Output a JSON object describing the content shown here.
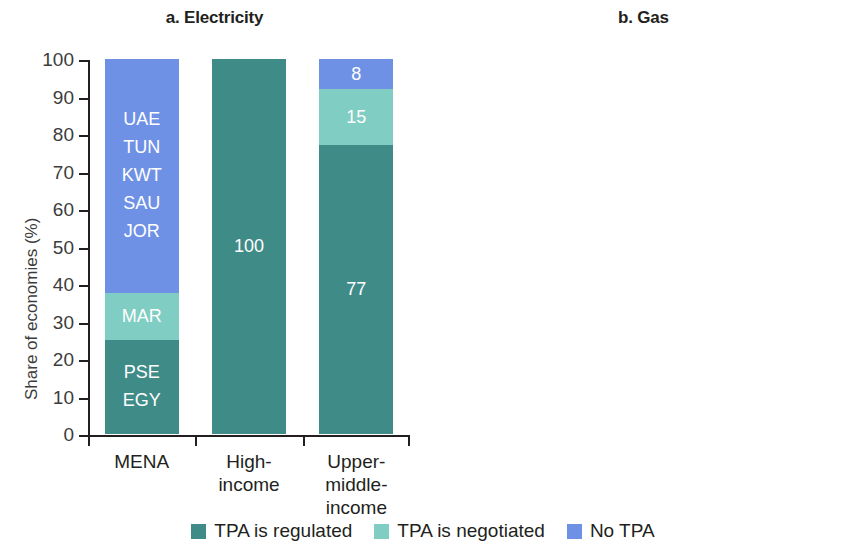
{
  "figure": {
    "ylabel": "Share of economies (%)",
    "y_ticks": [
      "100",
      "90",
      "80",
      "70",
      "60",
      "50",
      "40",
      "30",
      "20",
      "10",
      "0"
    ],
    "categories": [
      "MENA",
      "High-\nincome",
      "Upper-\nmiddle-\nincome"
    ]
  },
  "colors": {
    "regulated": "#3f8b88",
    "negotiated": "#7fcdc3",
    "no_tpa": "#6e91e6",
    "axis": "#231f20",
    "tick_text": "#3c3c3c"
  },
  "legend": {
    "items": [
      {
        "label": "TPA is regulated",
        "color": "#3f8b88"
      },
      {
        "label": "TPA is negotiated",
        "color": "#7fcdc3"
      },
      {
        "label": "No TPA",
        "color": "#6e91e6"
      }
    ]
  },
  "panels": [
    {
      "id": "a",
      "title": "a. Electricity",
      "ylabel": "Share of economies (%)",
      "bars": [
        {
          "category": "MENA",
          "category_lines": [
            "MENA"
          ],
          "segments": [
            {
              "series": "No TPA",
              "value": 62.5,
              "label": "",
              "economies": [
                "UAE",
                "TUN",
                "KWT",
                "SAU",
                "JOR"
              ]
            },
            {
              "series": "TPA is negotiated",
              "value": 12.5,
              "label": "",
              "economies": [
                "MAR"
              ]
            },
            {
              "series": "TPA is regulated",
              "value": 25,
              "label": "",
              "economies": [
                "PSE",
                "EGY"
              ]
            }
          ]
        },
        {
          "category": "High-income",
          "category_lines": [
            "High-",
            "income"
          ],
          "segments": [
            {
              "series": "TPA is regulated",
              "value": 100,
              "label": "100",
              "economies": []
            }
          ]
        },
        {
          "category": "Upper-middle-income",
          "category_lines": [
            "Upper-",
            "middle-",
            "income"
          ],
          "segments": [
            {
              "series": "No TPA",
              "value": 8,
              "label": "8",
              "economies": []
            },
            {
              "series": "TPA is negotiated",
              "value": 15,
              "label": "15",
              "economies": []
            },
            {
              "series": "TPA is regulated",
              "value": 77,
              "label": "77",
              "economies": []
            }
          ]
        }
      ]
    },
    {
      "id": "b",
      "title": "b. Gas",
      "ylabel": "Share of economies (%)",
      "bars": [
        {
          "category": "MENA",
          "category_lines": [
            "MENA"
          ],
          "segments": [
            {
              "series": "No TPA",
              "value": 62.5,
              "label": "",
              "economies": [
                "UAE",
                "TUN",
                "KWT",
                "SAU",
                "JOR"
              ]
            },
            {
              "series": "TPA is regulated",
              "value": 37.5,
              "label": "",
              "economies": [
                "PSE",
                "MAR",
                "EGY"
              ]
            }
          ]
        },
        {
          "category": "High-income",
          "category_lines": [
            "High-",
            "income"
          ],
          "segments": [
            {
              "series": "TPA is negotiated",
              "value": 12,
              "label": "12",
              "economies": []
            },
            {
              "series": "TPA is regulated",
              "value": 88,
              "label": "88",
              "economies": []
            }
          ]
        },
        {
          "category": "Upper-middle-income",
          "category_lines": [
            "Upper-",
            "middle-",
            "income"
          ],
          "segments": [
            {
              "series": "TPA is negotiated",
              "value": 8,
              "label": "8",
              "economies": []
            },
            {
              "series": "TPA is regulated",
              "value": 92,
              "label": "92",
              "economies": []
            }
          ]
        }
      ]
    }
  ],
  "chart_data": {
    "type": "bar",
    "subtype": "stacked-100",
    "xlabel": "",
    "ylabel": "Share of economies (%)",
    "ylim": [
      0,
      100
    ],
    "yticks": [
      0,
      10,
      20,
      30,
      40,
      50,
      60,
      70,
      80,
      90,
      100
    ],
    "grid": false,
    "legend_position": "bottom-center",
    "legend": [
      "TPA is regulated",
      "TPA is negotiated",
      "No TPA"
    ],
    "panels": [
      {
        "panel": "a",
        "title": "a. Electricity",
        "categories": [
          "MENA",
          "High-income",
          "Upper-middle-income"
        ],
        "series": [
          {
            "name": "TPA is regulated",
            "color": "#3f8b88",
            "values": [
              25,
              100,
              77
            ]
          },
          {
            "name": "TPA is negotiated",
            "color": "#7fcdc3",
            "values": [
              12.5,
              0,
              15
            ]
          },
          {
            "name": "No TPA",
            "color": "#6e91e6",
            "values": [
              62.5,
              0,
              8
            ]
          }
        ],
        "data_labels": {
          "MENA": {
            "TPA is regulated": "PSE, EGY",
            "TPA is negotiated": "MAR",
            "No TPA": "UAE, TUN, KWT, SAU, JOR"
          },
          "High-income": {
            "TPA is regulated": "100"
          },
          "Upper-middle-income": {
            "TPA is regulated": "77",
            "TPA is negotiated": "15",
            "No TPA": "8"
          }
        }
      },
      {
        "panel": "b",
        "title": "b. Gas",
        "categories": [
          "MENA",
          "High-income",
          "Upper-middle-income"
        ],
        "series": [
          {
            "name": "TPA is regulated",
            "color": "#3f8b88",
            "values": [
              37.5,
              88,
              92
            ]
          },
          {
            "name": "TPA is negotiated",
            "color": "#7fcdc3",
            "values": [
              0,
              12,
              8
            ]
          },
          {
            "name": "No TPA",
            "color": "#6e91e6",
            "values": [
              62.5,
              0,
              0
            ]
          }
        ],
        "data_labels": {
          "MENA": {
            "TPA is regulated": "PSE, MAR, EGY",
            "No TPA": "UAE, TUN, KWT, SAU, JOR"
          },
          "High-income": {
            "TPA is regulated": "88",
            "TPA is negotiated": "12"
          },
          "Upper-middle-income": {
            "TPA is regulated": "92",
            "TPA is negotiated": "8"
          }
        }
      }
    ]
  }
}
